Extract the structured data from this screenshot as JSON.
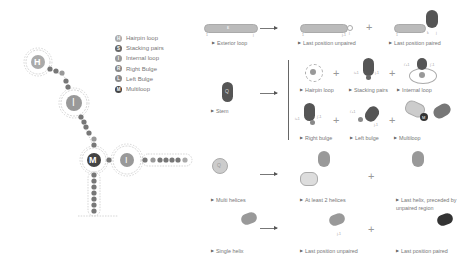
{
  "legend": {
    "items": [
      {
        "glyph": "H",
        "label": "Hairpin loop",
        "color": "#aaaaaa"
      },
      {
        "glyph": "S",
        "label": "Stacking pairs",
        "color": "#666666"
      },
      {
        "glyph": "I",
        "label": "Internal loop",
        "color": "#999999"
      },
      {
        "glyph": "R",
        "label": "Right Bulge",
        "color": "#888888"
      },
      {
        "glyph": "L",
        "label": "Left Bulge",
        "color": "#8a8a8a"
      },
      {
        "glyph": "M",
        "label": "Multiloop",
        "color": "#444444"
      }
    ]
  },
  "structure": {
    "labels": {
      "hairpin": "H",
      "internal_top": "I",
      "multiloop": "M",
      "internal_right": "I"
    }
  },
  "rules": {
    "exterior": {
      "lhs": "Exterior loop",
      "rhs": [
        "Last position unpaired",
        "Last position paired"
      ],
      "lhs_idx": [
        "1",
        "j"
      ],
      "rhs1_idx": [
        "1",
        "j-1",
        "j"
      ],
      "rhs2_idx": [
        "1",
        "k",
        "j"
      ],
      "glyph": "ε"
    },
    "stem": {
      "lhs": "Stem",
      "rhs": [
        "Hairpin loop",
        "Stacking pairs",
        "Internal loop",
        "Right bulge",
        "Left bulge",
        "Multiloop"
      ],
      "idx": {
        "stack_l": "i+1",
        "stack_r": "j-1",
        "int_l": "i'+1",
        "int_r": "j'-1",
        "rb_l": "i+1",
        "rb_r": "j'-1",
        "lb_l": "i'+1",
        "lb_r": "j-1"
      },
      "glyph": "Q",
      "multiloop_glyph": "M"
    },
    "multi": {
      "lhs": "Multi helices",
      "rhs": [
        "At least 2 helices",
        "Last helix, preceded by unpaired region"
      ],
      "glyph": "Q"
    },
    "single": {
      "lhs": "Single helix",
      "rhs": [
        "Last position unpaired",
        "Last position paired"
      ],
      "idx": "j-1",
      "glyph": "Q"
    }
  },
  "symbols": {
    "plus": "+"
  }
}
